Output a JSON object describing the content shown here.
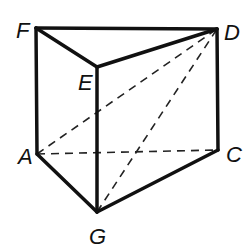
{
  "diagram": {
    "type": "triangular-prism",
    "vertices": {
      "F": {
        "x": 36,
        "y": 28,
        "label": "F",
        "lx": 16,
        "ly": 38
      },
      "D": {
        "x": 217,
        "y": 29,
        "label": "D",
        "lx": 224,
        "ly": 40
      },
      "E": {
        "x": 97,
        "y": 67,
        "label": "E",
        "lx": 78,
        "ly": 90
      },
      "A": {
        "x": 37,
        "y": 154,
        "label": "A",
        "lx": 18,
        "ly": 164
      },
      "C": {
        "x": 218,
        "y": 150,
        "label": "C",
        "lx": 226,
        "ly": 162
      },
      "G": {
        "x": 97,
        "y": 212,
        "label": "G",
        "lx": 89,
        "ly": 244
      }
    },
    "solid_edges": [
      [
        "F",
        "D"
      ],
      [
        "F",
        "E"
      ],
      [
        "E",
        "D"
      ],
      [
        "F",
        "A"
      ],
      [
        "E",
        "G"
      ],
      [
        "D",
        "C"
      ],
      [
        "A",
        "G"
      ],
      [
        "G",
        "C"
      ]
    ],
    "dashed_edges": [
      [
        "A",
        "C"
      ],
      [
        "A",
        "D"
      ],
      [
        "G",
        "D"
      ]
    ]
  }
}
